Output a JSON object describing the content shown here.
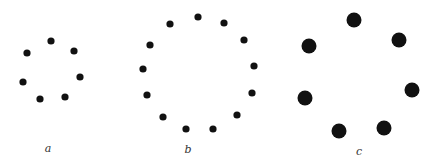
{
  "figure": {
    "background": "#ffffff",
    "dot_color": "#111111",
    "panels": [
      {
        "id": "a",
        "label": "a",
        "label_pos": [
          48,
          152
        ],
        "dot_radius": 3.6,
        "dots": [
          [
            51,
            41
          ],
          [
            74,
            51
          ],
          [
            80,
            77
          ],
          [
            65,
            97
          ],
          [
            40,
            99
          ],
          [
            23,
            82
          ],
          [
            27,
            53
          ]
        ]
      },
      {
        "id": "b",
        "label": "b",
        "label_pos": [
          188,
          153
        ],
        "dot_radius": 3.6,
        "dots": [
          [
            198,
            17
          ],
          [
            224,
            23
          ],
          [
            244,
            40
          ],
          [
            254,
            66
          ],
          [
            252,
            93
          ],
          [
            237,
            115
          ],
          [
            213,
            129
          ],
          [
            186,
            129
          ],
          [
            163,
            117
          ],
          [
            147,
            95
          ],
          [
            143,
            69
          ],
          [
            150,
            45
          ],
          [
            170,
            24
          ]
        ]
      },
      {
        "id": "c",
        "label": "c",
        "label_pos": [
          359,
          155
        ],
        "dot_radius": 7.5,
        "dots": [
          [
            354,
            20
          ],
          [
            399,
            40
          ],
          [
            412,
            90
          ],
          [
            384,
            128
          ],
          [
            339,
            131
          ],
          [
            305,
            98
          ],
          [
            309,
            46
          ]
        ]
      }
    ]
  }
}
